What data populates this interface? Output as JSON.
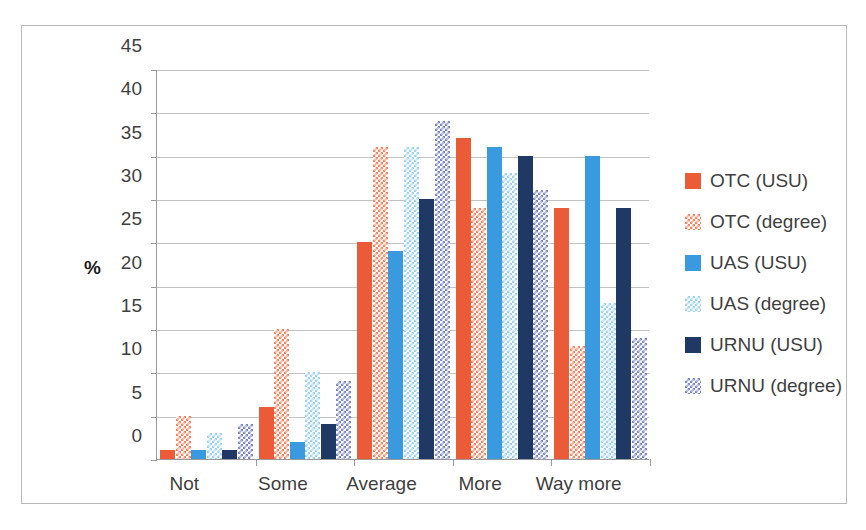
{
  "chart_data": {
    "type": "bar",
    "title": "",
    "subtitle": "",
    "xlabel": "",
    "ylabel": "%",
    "ylim": [
      0,
      45
    ],
    "ytick_step": 5,
    "yticks": [
      45,
      40,
      35,
      30,
      25,
      20,
      15,
      10,
      5,
      0
    ],
    "grid": true,
    "legend_position": "right",
    "categories": [
      "Not",
      "Some",
      "Average",
      "More",
      "Way more"
    ],
    "series": [
      {
        "name": "OTC (USU)",
        "color": "#ec5b38",
        "pattern": "solid",
        "values": [
          1,
          6,
          25,
          37,
          29
        ]
      },
      {
        "name": "OTC (degree)",
        "color": "#f4825f",
        "pattern": "checker",
        "values": [
          5,
          15,
          36,
          29,
          13
        ]
      },
      {
        "name": "UAS (USU)",
        "color": "#3a9ae0",
        "pattern": "solid",
        "values": [
          1,
          2,
          24,
          36,
          35
        ]
      },
      {
        "name": "UAS (degree)",
        "color": "#9bd1f2",
        "pattern": "checker",
        "values": [
          3,
          10,
          36,
          33,
          18
        ]
      },
      {
        "name": "URNU (USU)",
        "color": "#1f3864",
        "pattern": "solid",
        "values": [
          1,
          4,
          30,
          35,
          29
        ]
      },
      {
        "name": "URNU (degree)",
        "color": "#7a85c4",
        "pattern": "checker",
        "values": [
          4,
          9,
          39,
          31,
          14
        ]
      }
    ]
  },
  "legend": {
    "items": [
      {
        "label": "OTC (USU)"
      },
      {
        "label": "OTC (degree)"
      },
      {
        "label": "UAS (USU)"
      },
      {
        "label": "UAS (degree)"
      },
      {
        "label": "URNU (USU)"
      },
      {
        "label": "URNU (degree)"
      }
    ]
  },
  "axes": {
    "y_title": "%",
    "y_labels": [
      "45",
      "40",
      "35",
      "30",
      "25",
      "20",
      "15",
      "10",
      "5",
      "0"
    ],
    "x_labels": [
      "Not",
      "Some",
      "Average",
      "More",
      "Way more"
    ]
  },
  "colors": {
    "otc_usu": "#ec5b38",
    "otc_degree": "#f4825f",
    "uas_usu": "#3a9ae0",
    "uas_degree": "#9bd1f2",
    "urnu_usu": "#1f3864",
    "urnu_degree": "#7a85c4",
    "gridline": "#c3c3c3",
    "axis": "#9a9a9a",
    "frame": "#b9b9b9",
    "text": "#3f3f3f"
  }
}
